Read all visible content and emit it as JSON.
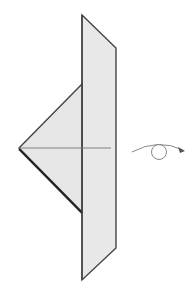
{
  "diagram": {
    "type": "origami-step",
    "colors": {
      "paper_fill": "#e8e8e8",
      "edge": "#444444",
      "crease": "#777777",
      "arrow": "#888888",
      "arrowhead": "#555555",
      "background": "#ffffff"
    },
    "shapes": {
      "strip": {
        "points": "82,15 116,48 116,248 82,280"
      },
      "triangle_flap": {
        "points": "82,84 19,148 82,212"
      },
      "crease_line": {
        "x1": 19,
        "y1": 148,
        "x2": 111,
        "y2": 148
      },
      "fold_line": {
        "x1": 82,
        "y1": 84,
        "x2": 82,
        "y2": 212
      }
    },
    "symbols": {
      "turn_over": {
        "name": "turn-over-arrow",
        "cx": 160,
        "cy": 152,
        "r": 8
      }
    }
  }
}
